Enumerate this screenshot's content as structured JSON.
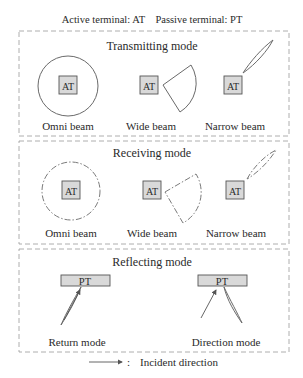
{
  "header": {
    "text": "Active terminal: AT    Passive terminal: PT",
    "active_label": "Active terminal: AT",
    "passive_label": "Passive terminal: PT"
  },
  "panels": [
    {
      "title": "Transmitting mode",
      "terminal": "AT",
      "line_style": "solid",
      "items": [
        {
          "label": "Omni beam",
          "beam": "omni"
        },
        {
          "label": "Wide beam",
          "beam": "wide"
        },
        {
          "label": "Narrow beam",
          "beam": "narrow"
        }
      ]
    },
    {
      "title": "Receiving mode",
      "terminal": "AT",
      "line_style": "dash-dot",
      "items": [
        {
          "label": "Omni beam",
          "beam": "omni"
        },
        {
          "label": "Wide beam",
          "beam": "wide"
        },
        {
          "label": "Narrow beam",
          "beam": "narrow"
        }
      ]
    },
    {
      "title": "Reflecting mode",
      "terminal": "PT",
      "items": [
        {
          "label": "Return mode",
          "beam": "return"
        },
        {
          "label": "Direction mode",
          "beam": "direction"
        }
      ]
    }
  ],
  "legend": {
    "symbol": "arrow",
    "separator": ":",
    "text": "Incident direction"
  },
  "colors": {
    "box_fill": "#d9d9d9",
    "line": "#6a6a6a",
    "frame": "#9a9a9a",
    "text": "#2a2a2a"
  }
}
